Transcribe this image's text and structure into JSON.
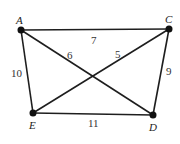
{
  "graph": {
    "vertices": [
      {
        "id": "A",
        "label": "A",
        "x": 21,
        "y": 30,
        "lx": 16,
        "ly": 24
      },
      {
        "id": "C",
        "label": "C",
        "x": 169,
        "y": 29,
        "lx": 165,
        "ly": 23
      },
      {
        "id": "E",
        "label": "E",
        "x": 33,
        "y": 113,
        "lx": 29,
        "ly": 128
      },
      {
        "id": "D",
        "label": "D",
        "x": 153,
        "y": 115,
        "lx": 149,
        "ly": 130
      }
    ],
    "edges": [
      {
        "from": "A",
        "to": "C",
        "weight": "7",
        "lx": 91,
        "ly": 44
      },
      {
        "from": "A",
        "to": "D",
        "weight": "6",
        "lx": 67,
        "ly": 59
      },
      {
        "from": "C",
        "to": "E",
        "weight": "5",
        "lx": 115,
        "ly": 58
      },
      {
        "from": "A",
        "to": "E",
        "weight": "10",
        "lx": 11,
        "ly": 77
      },
      {
        "from": "C",
        "to": "D",
        "weight": "9",
        "lx": 166,
        "ly": 75
      },
      {
        "from": "E",
        "to": "D",
        "weight": "11",
        "lx": 88,
        "ly": 127
      }
    ]
  }
}
